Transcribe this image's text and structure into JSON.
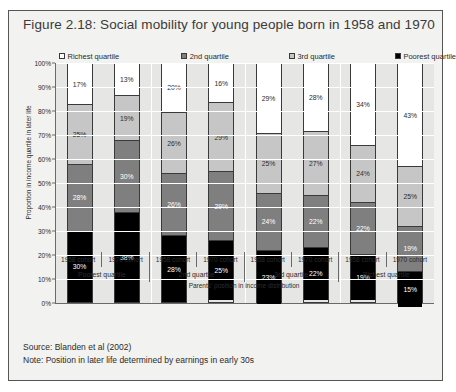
{
  "figure": {
    "title": "Figure 2.18: Social mobility for young people born in 1958 and 1970",
    "source_note": "Source: Blanden et al (2002)",
    "method_note": "Note: Position in later life determined by earnings in early 30s"
  },
  "colors": {
    "richest": "#ffffff",
    "second": "#7f7f7f",
    "third": "#c6c6c6",
    "poorest": "#000000",
    "plot_background": "#e6e6e4",
    "frame_background": "#f2f2f0",
    "gridline": "#ffffff",
    "axis": "#6a6a6a",
    "border": "#3a3a3a"
  },
  "chart_data": {
    "type": "bar",
    "title": "Figure 2.18: Social mobility for young people born in 1958 and 1970",
    "subtitle": "",
    "stacked": true,
    "stack_total": 100,
    "xlabel": "Parents' position in income distribution",
    "ylabel": "Proportion in income quartile in later life",
    "ylim": [
      0,
      100
    ],
    "yticks": [
      "0%",
      "10%",
      "20%",
      "30%",
      "40%",
      "50%",
      "60%",
      "70%",
      "80%",
      "90%",
      "100%"
    ],
    "ytick_values": [
      0,
      10,
      20,
      30,
      40,
      50,
      60,
      70,
      80,
      90,
      100
    ],
    "grid": true,
    "legend_position": "top",
    "legend": [
      {
        "label": "Richest quartile",
        "color": "#ffffff",
        "key": "richest"
      },
      {
        "label": "2nd quartile",
        "color": "#7f7f7f",
        "key": "second"
      },
      {
        "label": "3rd quartile",
        "color": "#c6c6c6",
        "key": "third"
      },
      {
        "label": "Poorest quartile",
        "color": "#000000",
        "key": "poorest"
      }
    ],
    "groups": [
      {
        "label": "Poorest quartile",
        "cohorts": [
          "1958 cohort",
          "1970 cohort"
        ]
      },
      {
        "label": "2nd quartile",
        "cohorts": [
          "1958 cohort",
          "1970 cohort"
        ]
      },
      {
        "label": "3rd quartile",
        "cohorts": [
          "1958 cohort",
          "1970 cohort"
        ]
      },
      {
        "label": "Richest quartile",
        "cohorts": [
          "1958 cohort",
          "1970 cohort"
        ]
      }
    ],
    "categories": [
      "Poorest quartile / 1958 cohort",
      "Poorest quartile / 1970 cohort",
      "2nd quartile / 1958 cohort",
      "2nd quartile / 1970 cohort",
      "3rd quartile / 1958 cohort",
      "3rd quartile / 1970 cohort",
      "Richest quartile / 1958 cohort",
      "Richest quartile / 1970 cohort"
    ],
    "series": [
      {
        "name": "Richest quartile",
        "color": "#ffffff",
        "values": [
          17,
          13,
          20,
          16,
          29,
          28,
          34,
          43
        ],
        "labels": [
          "17%",
          "13%",
          "20%",
          "16%",
          "29%",
          "28%",
          "34%",
          "43%"
        ]
      },
      {
        "name": "3rd quartile",
        "color": "#c6c6c6",
        "values": [
          25,
          19,
          26,
          29,
          25,
          27,
          24,
          25
        ],
        "labels": [
          "25%",
          "19%",
          "26%",
          "29%",
          "25%",
          "27%",
          "24%",
          "25%"
        ]
      },
      {
        "name": "2nd quartile",
        "color": "#7f7f7f",
        "values": [
          28,
          30,
          26,
          29,
          24,
          22,
          22,
          19
        ],
        "labels": [
          "28%",
          "30%",
          "26%",
          "29%",
          "24%",
          "22%",
          "22%",
          "19%"
        ]
      },
      {
        "name": "Poorest quartile",
        "color": "#000000",
        "values": [
          30,
          38,
          28,
          25,
          23,
          22,
          19,
          15
        ],
        "labels": [
          "30%",
          "38%",
          "28%",
          "25%",
          "23%",
          "22%",
          "19%",
          "15%"
        ]
      }
    ]
  }
}
